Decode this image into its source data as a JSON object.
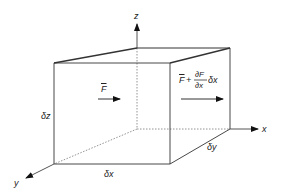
{
  "diagram": {
    "type": "control-volume-cube",
    "axes": {
      "x": "x",
      "y": "y",
      "z": "z"
    },
    "dimensions": {
      "dx": "δx",
      "dy": "δy",
      "dz": "δz"
    },
    "forces": {
      "inlet": "F",
      "outlet_base": "F",
      "outlet_plus": "+",
      "outlet_numerator": "∂F",
      "outlet_denominator": "∂x",
      "outlet_tail": "δx"
    },
    "colors": {
      "line": "#333333",
      "hidden_line": "#888888",
      "background": "#ffffff"
    }
  }
}
